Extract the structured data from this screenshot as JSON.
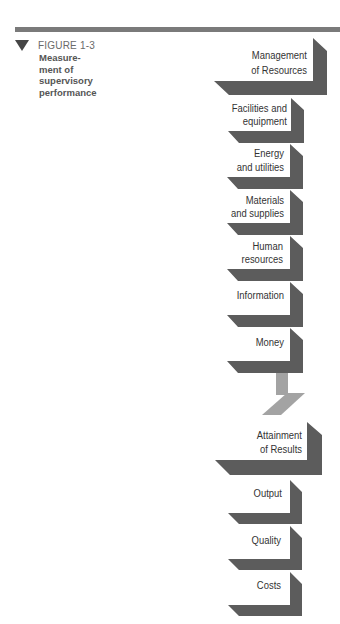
{
  "figure": {
    "marker_icon": "down-triangle",
    "label": "FIGURE 1-3",
    "caption_lines": [
      "Measure-",
      "ment of",
      "supervisory",
      "performance"
    ]
  },
  "diagram": {
    "resources": {
      "title_lines": [
        "Management",
        "of Resources"
      ],
      "items": [
        {
          "lines": [
            "Facilities and",
            "equipment"
          ]
        },
        {
          "lines": [
            "Energy",
            "and utilities"
          ]
        },
        {
          "lines": [
            "Materials",
            "and supplies"
          ]
        },
        {
          "lines": [
            "Human",
            "resources"
          ]
        },
        {
          "lines": [
            "Information"
          ]
        },
        {
          "lines": [
            "Money"
          ]
        }
      ]
    },
    "results": {
      "title_lines": [
        "Attainment",
        "of Results"
      ],
      "items": [
        {
          "lines": [
            "Output"
          ]
        },
        {
          "lines": [
            "Quality"
          ]
        },
        {
          "lines": [
            "Costs"
          ]
        }
      ]
    }
  },
  "colors": {
    "block_shadow": "#5c5c5c",
    "connector": "#a3a3a3",
    "top_rule": "#7a7a7a",
    "block_text": "#333333",
    "caption_text": "#555555",
    "label_text": "#6a6a6a"
  }
}
